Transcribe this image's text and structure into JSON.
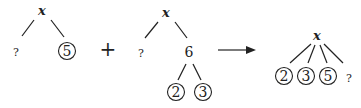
{
  "diagram": {
    "left_tree": {
      "root": "x",
      "children": [
        {
          "label": "?",
          "circled": false
        },
        {
          "label": "5",
          "circled": true
        }
      ]
    },
    "plus_operator": "+",
    "middle_tree": {
      "root": "x",
      "children": [
        {
          "label": "?",
          "circled": false
        },
        {
          "label": "6",
          "circled": false,
          "children": [
            {
              "label": "2",
              "circled": true
            },
            {
              "label": "3",
              "circled": true
            }
          ]
        }
      ]
    },
    "arrow": "→",
    "result_tree": {
      "root": "x",
      "children": [
        {
          "label": "2",
          "circled": true
        },
        {
          "label": "3",
          "circled": true
        },
        {
          "label": "5",
          "circled": true
        },
        {
          "label": "?",
          "circled": false
        }
      ]
    }
  }
}
